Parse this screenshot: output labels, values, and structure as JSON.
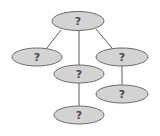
{
  "diagram": {
    "type": "tree",
    "colors": {
      "node_fill": "#d3d3d3",
      "node_stroke": "#6a6a6a",
      "edge": "#5a5a5a",
      "label": "#4a4a4a",
      "background": "#ffffff"
    },
    "nodes": [
      {
        "id": "root",
        "label": "?",
        "cx": 78,
        "cy": 21,
        "rx": 26,
        "ry": 9.5
      },
      {
        "id": "left",
        "label": "?",
        "cx": 37,
        "cy": 57,
        "rx": 25,
        "ry": 9
      },
      {
        "id": "middle",
        "label": "?",
        "cx": 79,
        "cy": 74,
        "rx": 25,
        "ry": 9
      },
      {
        "id": "right",
        "label": "?",
        "cx": 122,
        "cy": 57,
        "rx": 26,
        "ry": 9
      },
      {
        "id": "middle-child",
        "label": "?",
        "cx": 79,
        "cy": 115,
        "rx": 25,
        "ry": 9
      },
      {
        "id": "right-child",
        "label": "?",
        "cx": 122,
        "cy": 94,
        "rx": 26,
        "ry": 9
      }
    ],
    "edges": [
      {
        "from": "root",
        "to": "left",
        "x1": 61,
        "y1": 30,
        "x2": 46,
        "y2": 49
      },
      {
        "from": "root",
        "to": "middle",
        "x1": 79,
        "y1": 31,
        "x2": 79,
        "y2": 65
      },
      {
        "from": "root",
        "to": "right",
        "x1": 96,
        "y1": 29,
        "x2": 112,
        "y2": 48
      },
      {
        "from": "middle",
        "to": "middle-child",
        "x1": 79,
        "y1": 83,
        "x2": 79,
        "y2": 106
      },
      {
        "from": "right",
        "to": "right-child",
        "x1": 122,
        "y1": 66,
        "x2": 122,
        "y2": 85
      }
    ]
  }
}
